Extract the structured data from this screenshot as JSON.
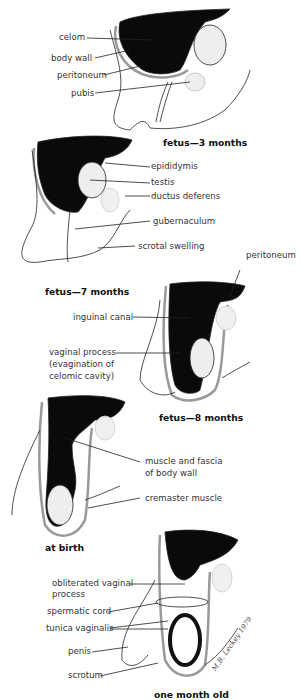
{
  "panels": [
    {
      "caption": "fetus—3 months",
      "labels": [
        "celom",
        "body wall",
        "peritoneum",
        "pubis"
      ]
    },
    {
      "caption": "fetus—7 months",
      "labels": [
        "epididymis",
        "testis",
        "ductus deferens",
        "gubernaculum",
        "scrotal swelling"
      ]
    },
    {
      "caption": "fetus—8 months",
      "labels": [
        "peritoneum",
        "inguinal canal",
        "vaginal process",
        "(evagination of",
        "celomic cavity)"
      ]
    },
    {
      "caption": "at birth",
      "labels": [
        "muscle and fascia",
        "of body wall",
        "cremaster muscle"
      ]
    },
    {
      "caption": "one month old",
      "labels": [
        "obliterated vaginal",
        "process",
        "spermatic cord",
        "tunica vaginalis",
        "penis",
        "scrotum"
      ]
    }
  ],
  "signature": {
    "name": "M.B. Leckey",
    "year": "1979"
  }
}
